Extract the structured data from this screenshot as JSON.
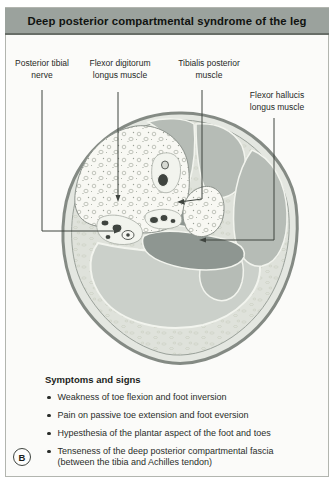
{
  "title": "Deep posterior compartmental syndrome of the leg",
  "figure_label": "B",
  "labels": {
    "posterior_tibial_nerve": "Posterior tibial nerve",
    "flexor_digitorum_longus": "Flexor digitorum longus muscle",
    "tibialis_posterior": "Tibialis posterior muscle",
    "flexor_hallucis_longus": "Flexor hallucis longus muscle"
  },
  "symptoms": {
    "heading": "Symptoms and signs",
    "items": [
      {
        "line1": "Weakness of toe flexion and foot inversion"
      },
      {
        "line1": "Pain on passive toe extension and foot eversion"
      },
      {
        "line1": "Hypesthesia of the plantar aspect of the foot and toes"
      },
      {
        "line1": "Tenseness of the deep posterior compartmental fascia",
        "line2": "(between the tibia and Achilles tendon)"
      }
    ]
  },
  "colors": {
    "title_bar_bg": "#9ba29d",
    "title_bar_edge": "#686e68",
    "panel_border": "#b2b5af",
    "skin_ring": "#e4e7e1",
    "subcutaneous": "#dfe2db",
    "superficial_muscle": "#cbd0ca",
    "muscle": "#b6bcb6",
    "deep_compartment_muscle": "#8e9691",
    "bone": "#f8f8f3",
    "vessel": "#3f443f",
    "leader_line": "#3f443f"
  }
}
